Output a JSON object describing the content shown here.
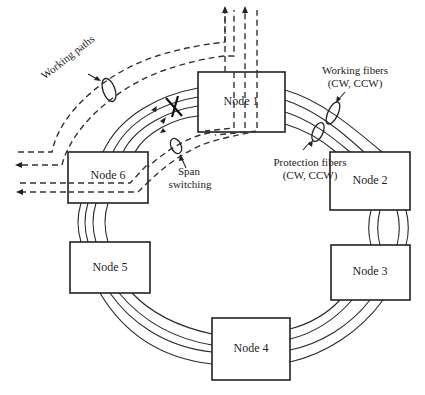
{
  "diagram": {
    "nodes": [
      {
        "id": "node-1",
        "label": "Node 1"
      },
      {
        "id": "node-2",
        "label": "Node 2"
      },
      {
        "id": "node-3",
        "label": "Node 3"
      },
      {
        "id": "node-4",
        "label": "Node 4"
      },
      {
        "id": "node-5",
        "label": "Node 5"
      },
      {
        "id": "node-6",
        "label": "Node 6"
      }
    ],
    "annotations": {
      "working_paths": "Working paths",
      "working_fibers_line1": "Working fibers",
      "working_fibers_line2": "(CW, CCW)",
      "protection_fibers_line1": "Protection fibers",
      "protection_fibers_line2": "(CW, CCW)",
      "span_switching_line1": "Span",
      "span_switching_line2": "switching"
    },
    "failure_marker": "X",
    "fibers_per_span": 4,
    "colors": {
      "line": "#222222",
      "background": "#ffffff"
    }
  }
}
